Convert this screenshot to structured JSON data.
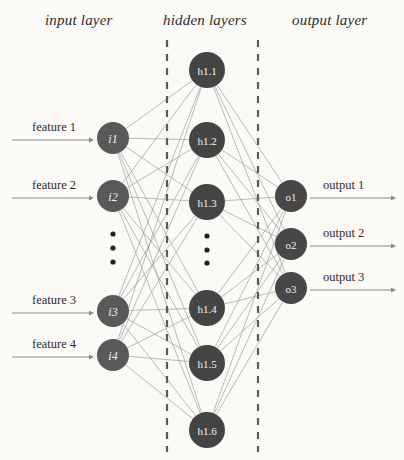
{
  "diagram": {
    "background_color": "#fbfaf7",
    "headers": [
      {
        "id": "input-layer-header",
        "text": "input layer",
        "x": 45,
        "y": 12
      },
      {
        "id": "hidden-layer-header",
        "text": "hidden layers",
        "x": 163,
        "y": 12
      },
      {
        "id": "output-layer-header",
        "text": "output layer",
        "x": 292,
        "y": 12
      }
    ],
    "colors": {
      "input_node": "#595959",
      "hidden_node": "#444444",
      "output_node": "#474747",
      "edge": "#9a9a9a",
      "arrow": "#8a8a8a",
      "dashed_divider": "#5a5a5a",
      "node_text": "#f2f2f2",
      "label_text": "#2b2b2b",
      "dot": "#222222"
    },
    "input_layer": {
      "node_radius": 16,
      "center_x": 113,
      "nodes": [
        {
          "id": "i1",
          "label": "i1",
          "x": 113,
          "y": 138
        },
        {
          "id": "i2",
          "label": "i2",
          "x": 113,
          "y": 196
        },
        {
          "id": "i3",
          "label": "i3",
          "x": 113,
          "y": 311
        },
        {
          "id": "i4",
          "label": "i4",
          "x": 113,
          "y": 355
        }
      ],
      "ellipsis": {
        "x": 113,
        "dots_y": [
          234,
          248,
          262
        ]
      },
      "feature_labels": [
        {
          "id": "feature-1",
          "text": "feature 1",
          "x": 32,
          "y": 120
        },
        {
          "id": "feature-2",
          "text": "feature 2",
          "x": 32,
          "y": 178
        },
        {
          "id": "feature-3",
          "text": "feature 3",
          "x": 32,
          "y": 293
        },
        {
          "id": "feature-4",
          "text": "feature 4",
          "x": 32,
          "y": 337
        }
      ],
      "arrows": [
        {
          "id": "input-arrow-1",
          "x1": 12,
          "x2": 94,
          "y": 140
        },
        {
          "id": "input-arrow-2",
          "x1": 12,
          "x2": 94,
          "y": 198
        },
        {
          "id": "input-arrow-3",
          "x1": 12,
          "x2": 94,
          "y": 313
        },
        {
          "id": "input-arrow-4",
          "x1": 12,
          "x2": 94,
          "y": 357
        }
      ]
    },
    "hidden_layer": {
      "node_radius": 18,
      "center_x": 207,
      "nodes": [
        {
          "id": "h1_1",
          "label": "h1.1",
          "x": 207,
          "y": 70
        },
        {
          "id": "h1_2",
          "label": "h1.2",
          "x": 207,
          "y": 140
        },
        {
          "id": "h1_3",
          "label": "h1.3",
          "x": 207,
          "y": 202
        },
        {
          "id": "h1_4",
          "label": "h1.4",
          "x": 207,
          "y": 308
        },
        {
          "id": "h1_5",
          "label": "h1.5",
          "x": 207,
          "y": 363
        },
        {
          "id": "h1_6",
          "label": "h1.6",
          "x": 207,
          "y": 430
        }
      ],
      "ellipsis": {
        "x": 207,
        "dots_y": [
          236,
          250,
          263
        ]
      },
      "dividers": [
        {
          "id": "divider-left",
          "x": 167,
          "y1": 40,
          "y2": 452
        },
        {
          "id": "divider-right",
          "x": 258,
          "y1": 40,
          "y2": 452
        }
      ]
    },
    "output_layer": {
      "node_radius": 16,
      "center_x": 291,
      "nodes": [
        {
          "id": "o1",
          "label": "o1",
          "x": 291,
          "y": 196
        },
        {
          "id": "o2",
          "label": "o2",
          "x": 291,
          "y": 244
        },
        {
          "id": "o3",
          "label": "o3",
          "x": 291,
          "y": 288
        }
      ],
      "output_labels": [
        {
          "id": "output-1",
          "text": "output 1",
          "x": 323,
          "y": 178
        },
        {
          "id": "output-2",
          "text": "output 2",
          "x": 323,
          "y": 226
        },
        {
          "id": "output-3",
          "text": "output 3",
          "x": 323,
          "y": 270
        }
      ],
      "arrows": [
        {
          "id": "output-arrow-1",
          "x1": 310,
          "x2": 396,
          "y": 198
        },
        {
          "id": "output-arrow-2",
          "x1": 310,
          "x2": 396,
          "y": 246
        },
        {
          "id": "output-arrow-3",
          "x1": 310,
          "x2": 396,
          "y": 290
        }
      ]
    },
    "edges": {
      "input_to_hidden_note": "fully connected: every input node connects to every hidden node",
      "hidden_to_output_note": "fully connected: every hidden node connects to every output node"
    }
  }
}
